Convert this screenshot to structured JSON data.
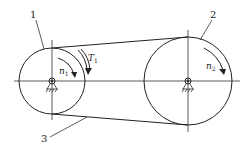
{
  "diagram": {
    "type": "belt-drive",
    "pulleys": [
      {
        "id": "1",
        "label": "1",
        "speed_label": "n",
        "speed_sub": "1",
        "torque_label": "T",
        "torque_sub": "1",
        "role": "driving pulley"
      },
      {
        "id": "2",
        "label": "2",
        "speed_label": "n",
        "speed_sub": "2",
        "role": "driven pulley"
      }
    ],
    "belt": {
      "label": "3"
    },
    "colors": {
      "line": "#222222",
      "background": "#ffffff"
    }
  }
}
